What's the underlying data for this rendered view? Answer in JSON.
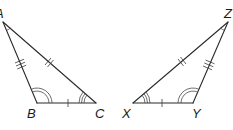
{
  "diagram": {
    "type": "congruent-triangles",
    "triangles": [
      {
        "name": "ABC",
        "vertices": [
          {
            "label": "A",
            "x": 3,
            "y": 22,
            "angle_marks": 1
          },
          {
            "label": "B",
            "x": 37,
            "y": 103,
            "angle_marks": 2
          },
          {
            "label": "C",
            "x": 96,
            "y": 103,
            "angle_marks": 3
          }
        ],
        "sides": [
          {
            "from": "B",
            "to": "C",
            "tick_marks": 1
          },
          {
            "from": "A",
            "to": "C",
            "tick_marks": 2
          },
          {
            "from": "A",
            "to": "B",
            "tick_marks": 3
          }
        ]
      },
      {
        "name": "XYZ",
        "vertices": [
          {
            "label": "X",
            "x": 133,
            "y": 103,
            "angle_marks": 3
          },
          {
            "label": "Y",
            "x": 193,
            "y": 103,
            "angle_marks": 2
          },
          {
            "label": "Z",
            "x": 228,
            "y": 22,
            "angle_marks": 1
          }
        ],
        "sides": [
          {
            "from": "X",
            "to": "Y",
            "tick_marks": 1
          },
          {
            "from": "X",
            "to": "Z",
            "tick_marks": 2
          },
          {
            "from": "Y",
            "to": "Z",
            "tick_marks": 3
          }
        ]
      }
    ],
    "labels": {
      "A": "A",
      "B": "B",
      "C": "C",
      "X": "X",
      "Y": "Y",
      "Z": "Z"
    },
    "colors": {
      "stroke": "#2b2b2b",
      "background": "#ffffff"
    }
  }
}
